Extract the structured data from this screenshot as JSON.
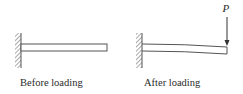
{
  "diagram": {
    "panels": [
      {
        "id": "before",
        "label": "Before loading"
      },
      {
        "id": "after",
        "label": "After loading",
        "load_label": "P"
      }
    ],
    "colors": {
      "stroke": "#555555",
      "text": "#2a2a2a",
      "background": "#ffffff"
    }
  }
}
